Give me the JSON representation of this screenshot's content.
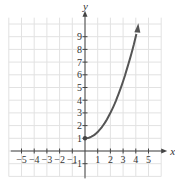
{
  "chart_data": {
    "type": "line",
    "title": "",
    "xlabel": "x",
    "ylabel": "y",
    "xlim": [
      -6,
      6
    ],
    "ylim": [
      -2,
      10.5
    ],
    "grid": true,
    "x_ticks": [
      "−5",
      "−4",
      "−3",
      "−2",
      "−1",
      "1",
      "2",
      "3",
      "4",
      "5"
    ],
    "y_ticks": [
      "−1",
      "1",
      "2",
      "3",
      "4",
      "5",
      "6",
      "7",
      "8",
      "9"
    ],
    "series": [
      {
        "name": "curve",
        "color": "#555555",
        "start_point": [
          0,
          1
        ],
        "end_arrow": true,
        "x": [
          0,
          0.5,
          1,
          1.5,
          2,
          2.5,
          3,
          3.5,
          4.2
        ],
        "values": [
          1,
          1.125,
          1.5,
          2.125,
          3,
          4.125,
          5.5,
          7.125,
          9.8
        ]
      }
    ]
  },
  "labels": {
    "x_axis": "x",
    "y_axis": "y"
  }
}
